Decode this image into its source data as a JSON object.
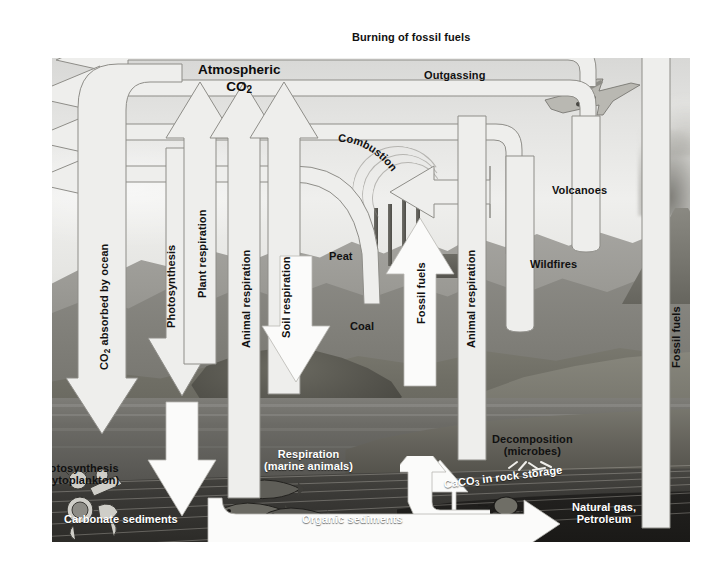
{
  "figure": {
    "title_line1": "Atmospheric",
    "title_line2_prefix": "CO",
    "title_line2_sub": "2",
    "kind": "carbon-cycle-diagram"
  },
  "atmosphere_flux_arrows": [
    {
      "label": "Burning of fossil fuels",
      "direction": "right-to-left",
      "row": 1
    },
    {
      "label": "Outgassing",
      "direction": "right-to-left",
      "row": 2
    },
    {
      "label": "",
      "direction": "right-to-left",
      "row": 3
    },
    {
      "label": "Combustion",
      "direction": "right-to-left",
      "row": 4
    }
  ],
  "vertical_flux_labels": [
    {
      "label_prefix": "CO",
      "label_sub": "2",
      "label_suffix": " absorbed by ocean",
      "direction": "down"
    },
    {
      "label": "Photosynthesis",
      "direction": "down"
    },
    {
      "label": "Plant respiration",
      "direction": "up"
    },
    {
      "label": "Animal respiration",
      "direction": "up"
    },
    {
      "label": "Soil respiration",
      "direction": "up"
    },
    {
      "label": "Fossil fuels",
      "direction": "up",
      "note": "center stack"
    },
    {
      "label": "Animal respiration",
      "direction": "up",
      "note": "marine"
    },
    {
      "label": "Wildfires",
      "direction": "up"
    },
    {
      "label": "Volcanoes",
      "direction": "up"
    },
    {
      "label": "Fossil fuels",
      "direction": "up",
      "note": "right edge"
    }
  ],
  "scene_labels": [
    {
      "name": "peat",
      "text": "Peat"
    },
    {
      "name": "coal",
      "text": "Coal"
    },
    {
      "name": "volcanoes",
      "text": "Volcanoes"
    },
    {
      "name": "wildfires",
      "text": "Wildfires"
    },
    {
      "name": "decomposition_line1",
      "text": "Decomposition"
    },
    {
      "name": "decomposition_line2",
      "text": "(microbes)"
    },
    {
      "name": "respiration_line1",
      "text": "Respiration"
    },
    {
      "name": "respiration_line2",
      "text": "(marine animals)"
    },
    {
      "name": "photosynthesis_line1",
      "text": "Photosynthesis"
    },
    {
      "name": "photosynthesis_line2",
      "text": "(phytoplankton)"
    },
    {
      "name": "carbonate_sediments",
      "text": "Carbonate sediments"
    },
    {
      "name": "organic_sediments",
      "text": "Organic sediments"
    },
    {
      "name": "caco3_prefix",
      "text": "CaCO"
    },
    {
      "name": "caco3_sub",
      "text": "3"
    },
    {
      "name": "caco3_suffix",
      "text": " in rock storage"
    },
    {
      "name": "natural_gas_line1",
      "text": "Natural gas,"
    },
    {
      "name": "natural_gas_line2",
      "text": "Petroleum"
    }
  ],
  "colors": {
    "arrow_fill": "#eeeeec",
    "arrow_stroke": "#8e8d88",
    "white_arrow": "#fbfbfa",
    "label_dark": "#111111",
    "label_light": "#ffffff",
    "sky": "#e6e6e3",
    "ocean_deep": "#3e3d3a",
    "page_background": "#ffffff"
  }
}
